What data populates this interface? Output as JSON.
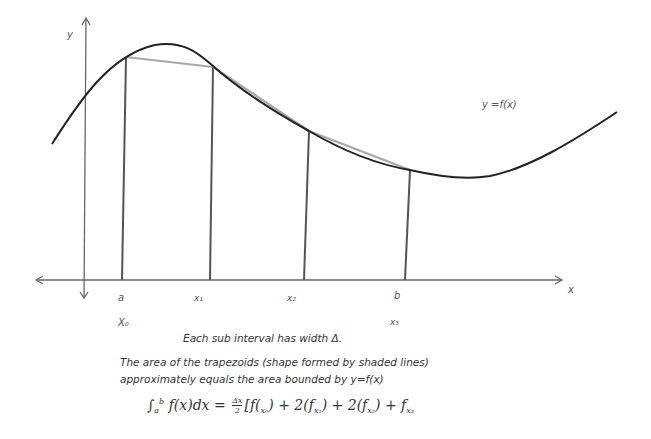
{
  "diagram": {
    "axes": {
      "y_label": "y",
      "x_label": "x"
    },
    "curve_label": "y =f(x)",
    "tick_labels": [
      {
        "top": "a",
        "bottom": "X₀"
      },
      {
        "top": "x₁",
        "bottom": ""
      },
      {
        "top": "x₂",
        "bottom": ""
      },
      {
        "top": "b",
        "bottom": "x₃"
      }
    ],
    "colors": {
      "curve": "#222222",
      "trapezoid_lines": "#555555",
      "trapezoid_top": "#888888",
      "axes": "#555555"
    }
  },
  "captions": {
    "width_note": "Each sub interval has width Δ.",
    "area_line1": "The area of the trapezoids (shape formed by shaded lines)",
    "area_line2": "approximately equals the area bounded by y=f(x)"
  },
  "formula": {
    "integral_lower": "a",
    "integral_upper": "b",
    "integrand": "f(x)dx =",
    "frac_num": "Δx",
    "frac_den": "2",
    "term0": "[f(",
    "term0_sub": "x₀",
    "term0_close": ") + 2(f",
    "term1_sub": "x₁",
    "term1_close": ") +  2(f",
    "term2_sub": "x₂",
    "term2_close": ") +  f",
    "term3_sub": "x₃"
  }
}
